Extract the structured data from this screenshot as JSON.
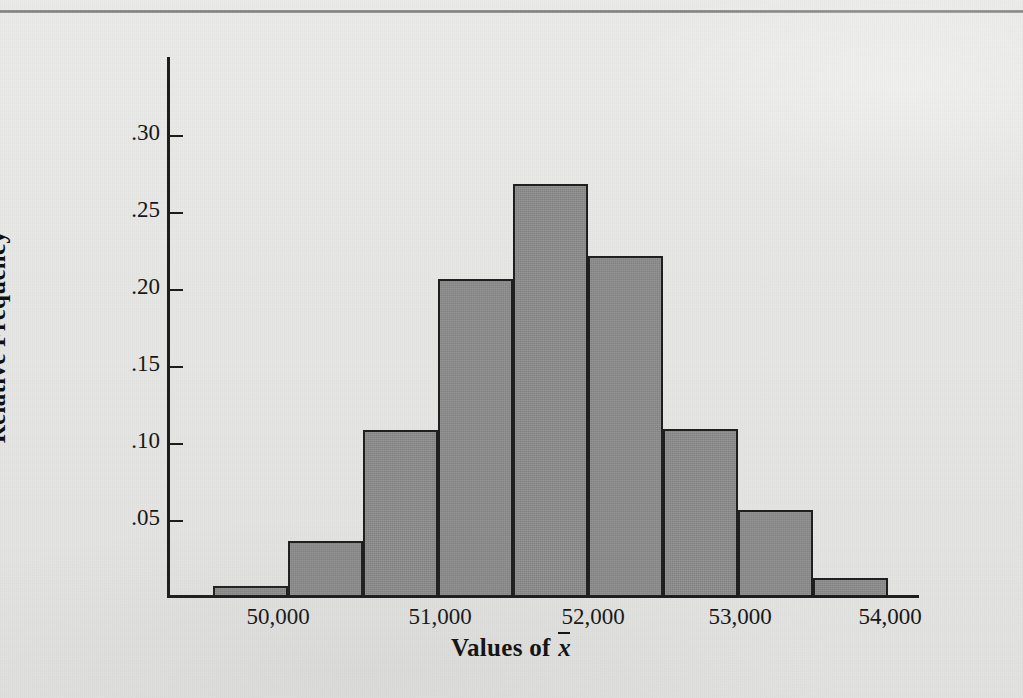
{
  "figure": {
    "y_axis_title": "Relative Frequency",
    "x_axis_title_prefix": "Values of ",
    "x_axis_title_variable": "x"
  },
  "chart_data": {
    "type": "bar",
    "title": "",
    "xlabel": "Values of x̄",
    "ylabel": "Relative Frequency",
    "grid": false,
    "legend": "none",
    "xlim": [
      49500,
      54500
    ],
    "ylim": [
      0,
      0.325
    ],
    "bin_width": 500,
    "x_tick_labels": [
      "50,000",
      "51,000",
      "52,000",
      "53,000",
      "54,000"
    ],
    "x_tick_values": [
      50000,
      51000,
      52000,
      53000,
      54000
    ],
    "y_tick_labels": [
      ".05",
      ".10",
      ".15",
      ".20",
      ".25",
      ".30"
    ],
    "y_tick_values": [
      0.05,
      0.1,
      0.15,
      0.2,
      0.25,
      0.3
    ],
    "categories": [
      "49,500-50,000",
      "50,000-50,500",
      "50,500-51,000",
      "51,000-51,500",
      "51,500-52,000",
      "52,000-52,500",
      "52,500-53,000",
      "53,000-53,500",
      "53,500-54,000",
      "54,000-54,500"
    ],
    "bin_starts": [
      49500,
      50000,
      50500,
      51000,
      51500,
      52000,
      52500,
      53000,
      53500,
      54000
    ],
    "values": [
      0.006,
      0.035,
      0.107,
      0.205,
      0.267,
      0.22,
      0.108,
      0.055,
      0.011,
      0.0
    ],
    "bar_fill_color": "#8b8b8b",
    "bar_edge_color": "#1f1f1f",
    "axis_color": "#1d1d1d",
    "background_color": "#e8e8e6"
  },
  "geometry": {
    "plot_left": 167,
    "plot_baseline": 595,
    "plot_top": 57,
    "bar_width": 75,
    "bar_origin_x": 213,
    "px_per_unit": 1540,
    "y_tick_px": [
      520,
      443,
      366,
      289,
      212,
      135
    ],
    "x_tick_px": [
      278,
      440,
      593,
      740,
      890
    ]
  }
}
